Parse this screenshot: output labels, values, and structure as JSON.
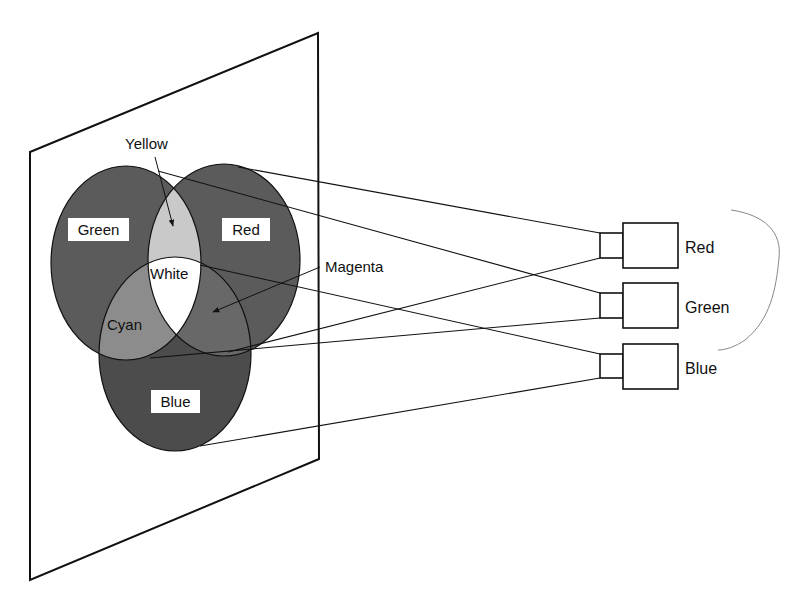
{
  "diagram": {
    "type": "additive-color-projection",
    "screen": {
      "corners": [
        [
          30,
          152
        ],
        [
          318,
          33
        ],
        [
          319,
          459
        ],
        [
          30,
          580
        ]
      ]
    },
    "circles": {
      "green": {
        "label": "Green",
        "cx": 126,
        "cy": 263,
        "rx": 75,
        "ry": 97
      },
      "red": {
        "label": "Red",
        "cx": 224,
        "cy": 260,
        "rx": 76,
        "ry": 96
      },
      "blue": {
        "label": "Blue",
        "cx": 175,
        "cy": 354,
        "rx": 76,
        "ry": 97
      }
    },
    "overlap_labels": {
      "yellow": "Yellow",
      "white": "White",
      "cyan": "Cyan",
      "magenta": "Magenta"
    },
    "projectors": [
      {
        "label": "Red",
        "y": 223
      },
      {
        "label": "Green",
        "y": 283
      },
      {
        "label": "Blue",
        "y": 344
      }
    ],
    "colors": {
      "primary_fill": "#5b5b5b",
      "blue_fill": "#4c4c4c",
      "yellow_fill": "#c9c9c9",
      "cyan_fill": "#8c8c8c",
      "magenta_fill": "#686868",
      "white_fill": "#ffffff",
      "stroke": "#111111",
      "pencil": "#888888"
    }
  }
}
